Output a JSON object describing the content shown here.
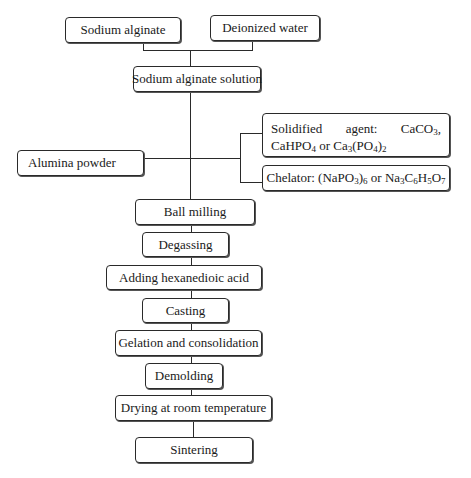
{
  "diagram": {
    "type": "process-flowchart",
    "inputs": {
      "sodium_alginate": "Sodium alginate",
      "deionized_water": "Deionized water"
    },
    "solution": "Sodium alginate solution",
    "alumina_powder": "Alumina powder",
    "additives": {
      "solidified_agent": {
        "prefix": "Solidified agent: CaCO",
        "parts": [
          "Solidified agent: CaCO",
          "3",
          ", CaHPO",
          "4",
          " or Ca",
          "3",
          "(PO",
          "4",
          ")",
          "2"
        ],
        "plain_text": "Solidified agent: CaCO3, CaHPO4 or Ca3(PO4)2"
      },
      "chelator": {
        "parts": [
          "Chelator: (NaPO",
          "3",
          ")",
          "6",
          " or Na",
          "3",
          "C",
          "6",
          "H",
          "5",
          "O",
          "7"
        ],
        "plain_text": "Chelator: (NaPO3)6 or Na3C6H5O7"
      }
    },
    "steps": [
      "Ball milling",
      "Degassing",
      "Adding hexanedioic acid",
      "Casting",
      "Gelation and consolidation",
      "Demolding",
      "Drying at room temperature",
      "Sintering"
    ],
    "colors": {
      "line": "#2a2a2a",
      "background": "#ffffff",
      "text": "#1a1a1a"
    }
  }
}
